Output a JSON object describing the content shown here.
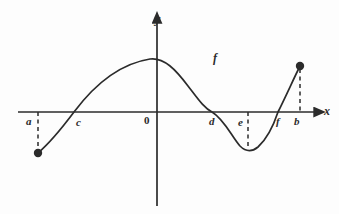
{
  "figure": {
    "title": "",
    "background_color": "#fdfdfd",
    "stroke_color": "#2b2b2b",
    "width": 339,
    "height": 214
  },
  "axes": {
    "x_axis_label": "x",
    "y_axis_label": "y",
    "origin_label": "0",
    "x_axis_pixel_y": 112,
    "y_axis_pixel_x": 157,
    "x_axis_start_x": 18,
    "x_axis_end_x": 322,
    "y_axis_top_y": 16,
    "y_axis_bottom_y": 206,
    "arrowheads": [
      "x-positive",
      "y-positive"
    ]
  },
  "curve": {
    "function_label": "f",
    "function_label_x": 213,
    "function_label_y": 52,
    "description": "smooth cubic-like curve rising from left endpoint, local maximum near x=0, falling through d, local minimum near e, rising steeply to right endpoint at b",
    "path": "M 38,153 C 52,141 62,128 74,112 C 92,88 118,64 150,59 C 164,57 176,70 188,86 C 198,99 204,108 212,112 C 224,119 232,137 240,146 C 246,152 252,152 258,147 C 268,138 274,124 278,112 C 286,96 294,78 300,66"
  },
  "x_marks": [
    {
      "id": "a",
      "label": "a",
      "label_x": 26,
      "label_y": 116,
      "axis_x": 38,
      "dashed": true,
      "dash_from_y": 112,
      "dash_to_y": 150,
      "endpoint_dot": true,
      "dot_x": 38,
      "dot_y": 153
    },
    {
      "id": "c",
      "label": "c",
      "label_x": 76,
      "label_y": 117,
      "axis_x": 74,
      "dashed": false,
      "endpoint_dot": false
    },
    {
      "id": "d",
      "label": "d",
      "label_x": 209,
      "label_y": 116,
      "axis_x": 212,
      "dashed": false,
      "endpoint_dot": false
    },
    {
      "id": "e",
      "label": "e",
      "label_x": 238,
      "label_y": 117,
      "axis_x": 248,
      "dashed": true,
      "dash_from_y": 112,
      "dash_to_y": 148,
      "endpoint_dot": false
    },
    {
      "id": "f",
      "label": "f",
      "label_x": 276,
      "label_y": 116,
      "axis_x": 278,
      "dashed": false,
      "endpoint_dot": false
    },
    {
      "id": "b",
      "label": "b",
      "label_x": 294,
      "label_y": 116,
      "axis_x": 300,
      "dashed": true,
      "dash_from_y": 69,
      "dash_to_y": 112,
      "endpoint_dot": true,
      "dot_x": 300,
      "dot_y": 66
    }
  ],
  "chart_data": {
    "type": "line",
    "title": "",
    "xlabel": "x",
    "ylabel": "y",
    "grid": false,
    "legend": null,
    "annotations": [
      {
        "text": "f",
        "note": "curve name label placed above the descending branch"
      },
      {
        "text": "0",
        "note": "origin label, left of y-axis below x-axis"
      }
    ],
    "x_tick_labels": [
      "a",
      "c",
      "0",
      "d",
      "e",
      "f",
      "b"
    ],
    "y_tick_labels": [],
    "domain_endpoints": {
      "left": "a",
      "right": "b"
    },
    "x_intercepts": [
      "c",
      "d",
      "f"
    ],
    "local_maximum_near": "0",
    "local_minimum_near": "e",
    "series": [
      {
        "name": "f",
        "note": "values are normalized graph-units read off the sketch; x-axis in units where 0 is the origin",
        "x": [
          -3.4,
          -3.0,
          -2.6,
          -2.2,
          -1.85,
          -1.4,
          -1.0,
          -0.5,
          -0.1,
          0.3,
          0.7,
          1.1,
          1.4,
          1.8,
          2.1,
          2.4,
          2.7,
          3.0,
          3.3,
          3.6,
          3.9,
          4.2
        ],
        "y": [
          -1.45,
          -1.05,
          -0.65,
          -0.2,
          0.0,
          0.55,
          0.95,
          1.2,
          1.3,
          1.25,
          1.05,
          0.72,
          0.4,
          0.0,
          -0.45,
          -0.78,
          -0.9,
          -0.78,
          -0.42,
          0.0,
          0.6,
          1.2
        ]
      }
    ],
    "xlim": [
      -3.6,
      4.4
    ],
    "ylim": [
      -1.8,
      1.6
    ]
  }
}
